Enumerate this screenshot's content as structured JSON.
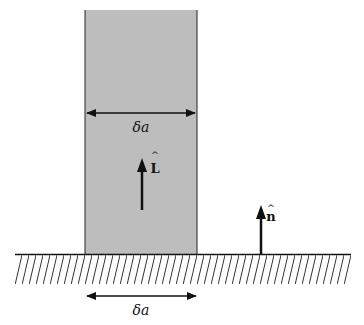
{
  "diagram": {
    "colors": {
      "strip_fill": "#bdbdbd",
      "line": "#111111",
      "background": "#ffffff"
    },
    "strip": {
      "width_label": "δa"
    },
    "vectors": {
      "L": {
        "label": "L",
        "hat": "^"
      },
      "n": {
        "label": "n",
        "hat": "^"
      }
    },
    "surface": {
      "width_label": "δa"
    }
  }
}
